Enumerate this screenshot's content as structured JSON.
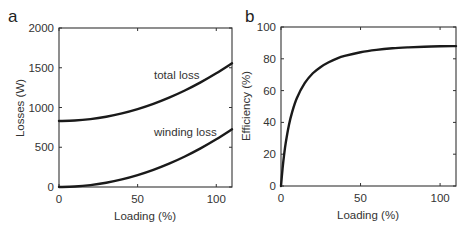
{
  "chart_data": [
    {
      "type": "line",
      "panel": "a",
      "title": "",
      "xlabel": "Loading (%)",
      "ylabel": "Losses (W)",
      "xlim": [
        0,
        110
      ],
      "ylim": [
        0,
        2000
      ],
      "xticks": [
        0,
        50,
        100
      ],
      "yticks": [
        0,
        500,
        1000,
        1500,
        2000
      ],
      "grid": false,
      "legend": "none (inline annotations)",
      "x": [
        0,
        10,
        20,
        30,
        40,
        50,
        60,
        70,
        80,
        90,
        100,
        110
      ],
      "series": [
        {
          "name": "total loss",
          "values": [
            830,
            836,
            854,
            884,
            926,
            980,
            1046,
            1124,
            1214,
            1316,
            1430,
            1556
          ]
        },
        {
          "name": "winding loss",
          "values": [
            0,
            6,
            24,
            54,
            96,
            150,
            216,
            294,
            384,
            486,
            600,
            726
          ]
        }
      ],
      "annotations": [
        {
          "text": "total loss",
          "x": 80,
          "y": 1500
        },
        {
          "text": "winding loss",
          "x": 80,
          "y": 740
        }
      ]
    },
    {
      "type": "line",
      "panel": "b",
      "title": "",
      "xlabel": "Loading (%)",
      "ylabel": "Efficiency (%)",
      "xlim": [
        0,
        110
      ],
      "ylim": [
        0,
        100
      ],
      "xticks": [
        0,
        50,
        100
      ],
      "yticks": [
        0,
        20,
        40,
        60,
        80,
        100
      ],
      "grid": false,
      "legend": "none",
      "x": [
        0,
        1,
        2,
        3,
        5,
        7,
        10,
        15,
        20,
        25,
        30,
        35,
        40,
        50,
        60,
        70,
        80,
        90,
        100,
        110
      ],
      "series": [
        {
          "name": "efficiency",
          "values": [
            0,
            11.1,
            20.0,
            27.3,
            38.4,
            46.5,
            55.4,
            64.8,
            70.9,
            74.9,
            77.8,
            80.1,
            81.8,
            84.1,
            85.6,
            86.6,
            87.2,
            87.6,
            87.9,
            88.0
          ]
        }
      ]
    }
  ],
  "panels": {
    "a": {
      "label": "a",
      "xlabel": "Loading (%)",
      "ylabel": "Losses (W)",
      "xtick_labels": [
        "0",
        "50",
        "100"
      ],
      "ytick_labels": [
        "0",
        "500",
        "1000",
        "1500",
        "2000"
      ],
      "annotations": [
        "total loss",
        "winding loss"
      ]
    },
    "b": {
      "label": "b",
      "xlabel": "Loading (%)",
      "ylabel": "Efficiency (%)",
      "xtick_labels": [
        "0",
        "50",
        "100"
      ],
      "ytick_labels": [
        "0",
        "20",
        "40",
        "60",
        "80",
        "100"
      ]
    }
  }
}
